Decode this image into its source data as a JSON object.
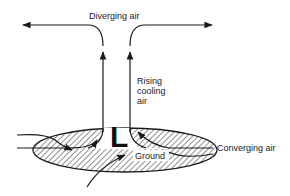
{
  "diagram": {
    "labels": {
      "diverging": "Diverging air",
      "rising_line1": "Rising",
      "rising_line2": "cooling",
      "rising_line3": "air",
      "converging": "Converging air",
      "ground": "Ground",
      "center_symbol": "L"
    },
    "colors": {
      "stroke": "#1a1a1a",
      "hatch": "#333333",
      "background": "#ffffff"
    }
  }
}
